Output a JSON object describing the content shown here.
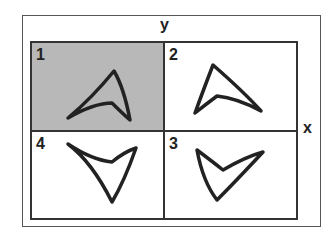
{
  "axes": {
    "y_label": "y",
    "x_label": "x"
  },
  "quadrants": [
    {
      "id": "q1",
      "label": "1",
      "fill": "#b8b8b8",
      "shape": "boomerang-pointing-up-right"
    },
    {
      "id": "q2",
      "label": "2",
      "fill": "#ffffff",
      "shape": "boomerang-pointing-up-left"
    },
    {
      "id": "q3",
      "label": "3",
      "fill": "#ffffff",
      "shape": "boomerang-pointing-down-left"
    },
    {
      "id": "q4",
      "label": "4",
      "fill": "#ffffff",
      "shape": "boomerang-pointing-down-right"
    }
  ],
  "colors": {
    "line": "#222222",
    "frame": "#333333",
    "shaded": "#b8b8b8"
  }
}
